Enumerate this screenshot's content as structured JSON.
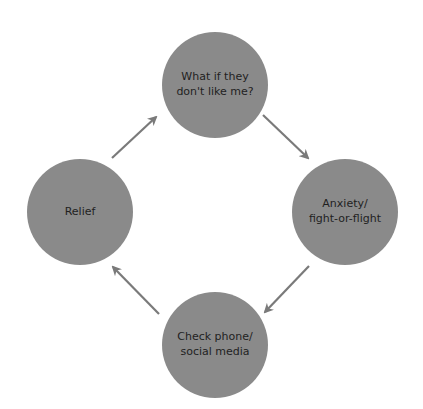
{
  "diagram": {
    "type": "cycle",
    "colors": {
      "node_fill": "#8a8a8a",
      "arrow": "#7a7a7a",
      "text": "#1f1f1f"
    },
    "nodes": [
      {
        "id": "top",
        "label": "What if they\ndon't like me?"
      },
      {
        "id": "right",
        "label": "Anxiety/\nfight-or-flight"
      },
      {
        "id": "bottom",
        "label": "Check phone/\nsocial media"
      },
      {
        "id": "left",
        "label": "Relief"
      }
    ],
    "edges": [
      {
        "from": "top",
        "to": "right"
      },
      {
        "from": "right",
        "to": "bottom"
      },
      {
        "from": "bottom",
        "to": "left"
      },
      {
        "from": "left",
        "to": "top"
      }
    ]
  }
}
